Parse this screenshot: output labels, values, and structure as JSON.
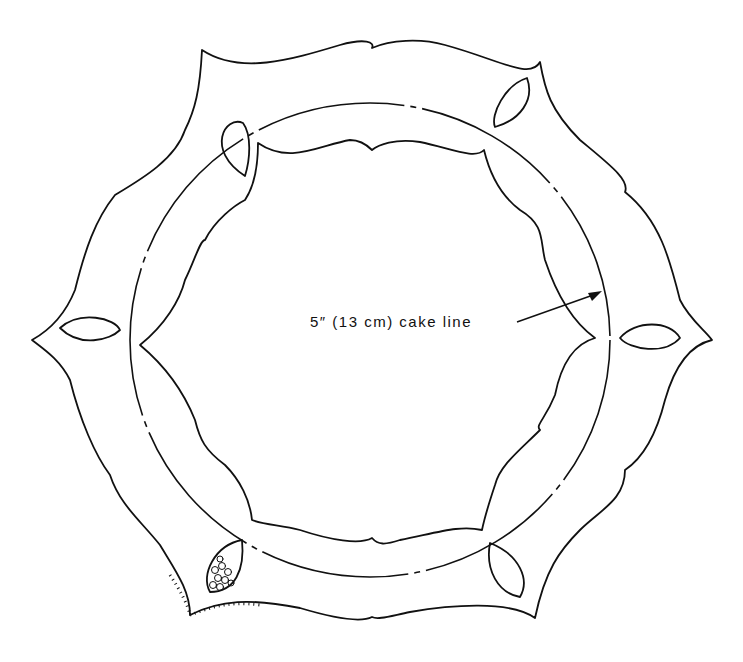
{
  "diagram": {
    "annotation": "5″ (13 cm)  cake  line",
    "stroke_color": "#111111",
    "background_color": "#ffffff",
    "parts": [
      "outer-collar-outline",
      "inner-collar-outline",
      "cake-line-circle",
      "leaf-cutout",
      "piped-filigree-sample"
    ]
  }
}
